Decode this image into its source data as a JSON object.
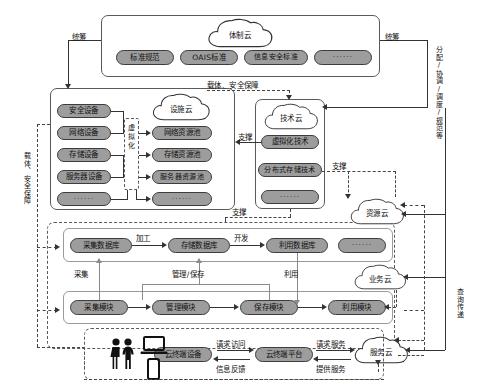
{
  "diagram": {
    "colors": {
      "node_fill": "#9d9d9d",
      "node_stroke": "#3d3d3d",
      "frame_stroke": "#5a5a5a",
      "line": "#333333",
      "background": "#ffffff"
    }
  },
  "institution_layer": {
    "cloud_label": "体制云",
    "nodes": [
      {
        "label": "标准规范"
      },
      {
        "label": "OAIS标准"
      },
      {
        "label": "信息安全标准"
      },
      {
        "label": "······"
      }
    ]
  },
  "infrastructure_layer": {
    "cloud_label": "设施云",
    "virtualization_label": "虚拟化",
    "devices": [
      {
        "label": "安全设备"
      },
      {
        "label": "网络设备"
      },
      {
        "label": "存储设备"
      },
      {
        "label": "服务器设备"
      },
      {
        "label": "······"
      }
    ],
    "pools": [
      {
        "label": "网络资源池"
      },
      {
        "label": "存储资源池"
      },
      {
        "label": "服务器资源池"
      },
      {
        "label": "······"
      }
    ]
  },
  "technology_layer": {
    "cloud_label": "技术云",
    "nodes": [
      {
        "label": "虚拟化技术"
      },
      {
        "label": "分布式存储技术"
      },
      {
        "label": "······"
      }
    ]
  },
  "database_layer": {
    "nodes": [
      {
        "label": "采集数据库"
      },
      {
        "label": "存储数据库"
      },
      {
        "label": "利用数据库"
      },
      {
        "label": "······"
      }
    ],
    "flow_labels": [
      {
        "label": "加工"
      },
      {
        "label": "开发"
      }
    ]
  },
  "module_layer": {
    "nodes": [
      {
        "label": "采集模块"
      },
      {
        "label": "管理模块"
      },
      {
        "label": "保存模块"
      },
      {
        "label": "利用模块"
      }
    ],
    "vertical_labels": [
      {
        "label": "采集"
      },
      {
        "label": "管理/保存"
      },
      {
        "label": "利用"
      }
    ]
  },
  "terminal_layer": {
    "nodes": [
      {
        "label": "云终端设备"
      },
      {
        "label": "云终端平台"
      }
    ],
    "flow_labels": [
      {
        "label": "请求访问"
      },
      {
        "label": "信息反馈"
      },
      {
        "label": "请求服务"
      },
      {
        "label": "提供服务"
      }
    ],
    "icons": [
      {
        "name": "people-icon"
      },
      {
        "name": "laptop-icon"
      },
      {
        "name": "smartphone-icon"
      }
    ]
  },
  "right_clouds": [
    {
      "label": "资源云"
    },
    {
      "label": "业务云"
    },
    {
      "label": "服务云"
    }
  ],
  "edge_labels": {
    "overall_left": "统筹",
    "overall_right": "统筹",
    "carrier_top": "载体、安全保障",
    "carrier_left": "载体、安全保障",
    "allocation_right": "分配/协调/调度/规范等",
    "query_right": "查询传递",
    "support_mid": "支撑",
    "support_lower": "支撑",
    "support_bottom": "支撑"
  }
}
